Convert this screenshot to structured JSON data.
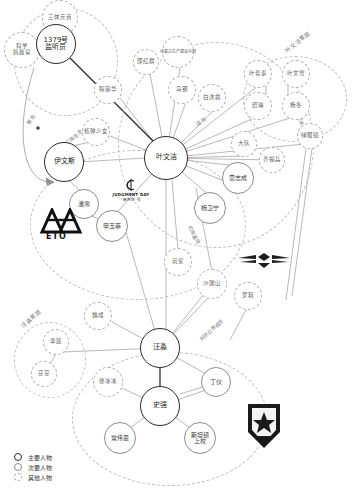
{
  "legend": {
    "items": [
      {
        "key": "main",
        "label": "主要人物"
      },
      {
        "key": "secondary",
        "label": "次要人物"
      },
      {
        "key": "other",
        "label": "其他人物"
      }
    ]
  },
  "colors": {
    "main_stroke": "#2a2a2a",
    "secondary_stroke": "#8c8c8c",
    "other_stroke": "#b0b0b0",
    "edge": "#9a9a9a",
    "edge_strong": "#333333",
    "background": "#ffffff"
  },
  "groups": [
    {
      "id": "g-trisolaris",
      "label": "",
      "x": 14,
      "y": 8,
      "w": 104,
      "h": 108
    },
    {
      "id": "g-ye-family",
      "label": "叶文洁家庭",
      "lx": 286,
      "ly": 47,
      "rot": -38,
      "x": 243,
      "y": 56,
      "w": 104,
      "h": 86
    },
    {
      "id": "g-wang-family",
      "label": "汪淼家庭",
      "lx": 24,
      "ly": 320,
      "rot": -40,
      "x": 14,
      "y": 322,
      "w": 72,
      "h": 76
    },
    {
      "id": "g-eto-ring",
      "label": "",
      "x": 30,
      "y": 150,
      "w": 216,
      "h": 150
    },
    {
      "id": "g-police",
      "label": "",
      "x": 72,
      "y": 352,
      "w": 196,
      "h": 134
    },
    {
      "id": "g-redcoast",
      "label": "",
      "x": 118,
      "y": 42,
      "w": 196,
      "h": 206
    }
  ],
  "nodes": [
    {
      "id": "sanTiYuanShou",
      "label": "三体元首",
      "type": "other",
      "x": 60,
      "y": 18,
      "r": 18
    },
    {
      "id": "kexueZhizhengguan",
      "label": "科学\n执政官",
      "type": "other",
      "x": 22,
      "y": 50,
      "r": 18
    },
    {
      "id": "jianTingYuan",
      "label": "1379号\n监听员",
      "type": "main",
      "x": 56,
      "y": 44,
      "r": 20
    },
    {
      "id": "yiWensi",
      "label": "伊文斯",
      "type": "main",
      "x": 64,
      "y": 162,
      "r": 20
    },
    {
      "id": "panHan",
      "label": "潘寒",
      "type": "secondary",
      "x": 84,
      "y": 204,
      "r": 15
    },
    {
      "id": "shenYufei",
      "label": "申玉菲",
      "type": "secondary",
      "x": 112,
      "y": 226,
      "r": 16
    },
    {
      "id": "weiCheng",
      "label": "魏成",
      "type": "other",
      "x": 98,
      "y": 316,
      "r": 14
    },
    {
      "id": "yeWenjie",
      "label": "叶文洁",
      "type": "main",
      "x": 166,
      "y": 158,
      "r": 22
    },
    {
      "id": "zhadanShaonv",
      "label": "核弹少女",
      "type": "other",
      "x": 96,
      "y": 132,
      "r": 14
    },
    {
      "id": "chengLihua",
      "label": "程丽华",
      "type": "other",
      "x": 108,
      "y": 90,
      "r": 14
    },
    {
      "id": "shaoHongjun",
      "label": "邵红群",
      "type": "other",
      "x": 146,
      "y": 62,
      "r": 13
    },
    {
      "id": "neimengguBingtuan",
      "label": "内蒙古生产建设兵团",
      "type": "other",
      "x": 178,
      "y": 52,
      "r": 16
    },
    {
      "id": "maGang",
      "label": "马钢",
      "type": "other",
      "x": 182,
      "y": 90,
      "r": 14
    },
    {
      "id": "baiMurong",
      "label": "白沐霖",
      "type": "other",
      "x": 212,
      "y": 98,
      "r": 14
    },
    {
      "id": "daShi2",
      "label": "大队",
      "type": "other",
      "x": 244,
      "y": 144,
      "r": 13
    },
    {
      "id": "qiFubing",
      "label": "齐福兵",
      "type": "other",
      "x": 272,
      "y": 160,
      "r": 13
    },
    {
      "id": "leiZhicheng",
      "label": "雷志成",
      "type": "secondary",
      "x": 238,
      "y": 178,
      "r": 16
    },
    {
      "id": "yangWeining",
      "label": "杨卫宁",
      "type": "secondary",
      "x": 210,
      "y": 208,
      "r": 16
    },
    {
      "id": "yeZhetai",
      "label": "叶哲泰",
      "type": "other",
      "x": 258,
      "y": 74,
      "r": 14
    },
    {
      "id": "yeWenxue",
      "label": "叶文雪",
      "type": "other",
      "x": 296,
      "y": 74,
      "r": 14
    },
    {
      "id": "shaoLin",
      "label": "绍琳",
      "type": "other",
      "x": 258,
      "y": 106,
      "r": 14
    },
    {
      "id": "yangDong",
      "label": "杨冬",
      "type": "other",
      "x": 296,
      "y": 106,
      "r": 14
    },
    {
      "id": "lvYanjing",
      "label": "绿眼镜",
      "type": "other",
      "x": 310,
      "y": 136,
      "r": 13
    },
    {
      "id": "wanJia",
      "label": "玩家",
      "type": "other",
      "x": 178,
      "y": 262,
      "r": 14
    },
    {
      "id": "shaRuishan",
      "label": "沙瑞山",
      "type": "other",
      "x": 212,
      "y": 284,
      "r": 15
    },
    {
      "id": "luoJi",
      "label": "罗辑",
      "type": "other",
      "x": 248,
      "y": 296,
      "r": 14
    },
    {
      "id": "wangMiao",
      "label": "汪淼",
      "type": "main",
      "x": 160,
      "y": 348,
      "r": 20
    },
    {
      "id": "shiQiang",
      "label": "史强",
      "type": "main",
      "x": 160,
      "y": 406,
      "r": 20
    },
    {
      "id": "xuBingbing",
      "label": "徐冰冰",
      "type": "other",
      "x": 108,
      "y": 382,
      "r": 15
    },
    {
      "id": "dingYi",
      "label": "丁仪",
      "type": "secondary",
      "x": 216,
      "y": 382,
      "r": 15
    },
    {
      "id": "changWeisi",
      "label": "常伟思",
      "type": "secondary",
      "x": 120,
      "y": 438,
      "r": 16
    },
    {
      "id": "sitandunShangxiao",
      "label": "斯坦顿\n上校",
      "type": "secondary",
      "x": 200,
      "y": 438,
      "r": 16
    },
    {
      "id": "liYao",
      "label": "李瑶",
      "type": "other",
      "x": 56,
      "y": 342,
      "r": 13
    },
    {
      "id": "douDou",
      "label": "豆豆",
      "type": "other",
      "x": 44,
      "y": 374,
      "r": 13
    }
  ],
  "edge_labels": [
    {
      "id": "el-jinggao",
      "text": "警告",
      "x": 60,
      "y": 128,
      "rot": -62
    },
    {
      "id": "el-zhidao",
      "text": "知道三体信息",
      "x": 70,
      "y": 140,
      "rot": -40
    },
    {
      "id": "el-baimulin",
      "text": "送书",
      "x": 196,
      "y": 126,
      "rot": -30
    },
    {
      "id": "el-hongan",
      "text": "红岸基地",
      "x": 196,
      "y": 226,
      "rot": 60
    },
    {
      "id": "el-naimi",
      "text": "纳米材料",
      "x": 310,
      "y": 120,
      "rot": 70
    },
    {
      "id": "el-kexuebj",
      "text": "科学边界成员",
      "x": 214,
      "y": 330,
      "rot": -42
    }
  ],
  "emblems": [
    {
      "id": "eto-logo",
      "name": "eto-emblem",
      "caption": "ETO"
    },
    {
      "id": "judgment-day",
      "name": "judgment-day-emblem",
      "line1": "JUDGMENT DAY",
      "line2": "\"审判日\"号"
    },
    {
      "id": "wings-emblem",
      "name": "air-force-wings-emblem"
    },
    {
      "id": "shield-emblem",
      "name": "battle-command-emblem"
    }
  ]
}
